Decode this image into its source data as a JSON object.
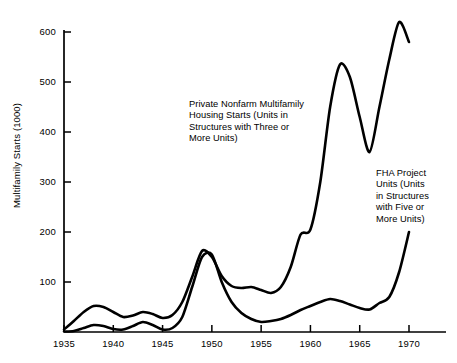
{
  "chart_data": {
    "type": "line",
    "title": "",
    "xlabel": "",
    "ylabel": "Multifamily Starts (1000)",
    "xlim": [
      1935,
      1971.5
    ],
    "ylim": [
      0,
      640
    ],
    "grid": false,
    "legend_position": "none (inline annotations)",
    "xticks": [
      "1935",
      "1940",
      "1945",
      "1950",
      "1955",
      "1960",
      "1965",
      "1970"
    ],
    "xtick_values": [
      1935,
      1940,
      1945,
      1950,
      1955,
      1960,
      1965,
      1970
    ],
    "yticks": [
      "100",
      "200",
      "300",
      "400",
      "500",
      "600"
    ],
    "ytick_values": [
      100,
      200,
      300,
      400,
      500,
      600
    ],
    "line_color": "#000000",
    "series": [
      {
        "name": "Private Nonfarm Multifamily Housing Starts (Units in Structures with Three or More Units)",
        "x": [
          1935,
          1936,
          1937,
          1938,
          1939,
          1940,
          1941,
          1942,
          1943,
          1944,
          1945,
          1946,
          1947,
          1948,
          1949,
          1950,
          1951,
          1952,
          1953,
          1954,
          1955,
          1956,
          1957,
          1958,
          1959,
          1960,
          1961,
          1962,
          1963,
          1964,
          1965,
          1966,
          1967,
          1968,
          1969,
          1970
        ],
        "values": [
          5,
          22,
          40,
          52,
          50,
          40,
          30,
          33,
          40,
          36,
          28,
          34,
          60,
          110,
          162,
          150,
          112,
          92,
          88,
          90,
          84,
          78,
          90,
          130,
          195,
          205,
          300,
          450,
          535,
          510,
          430,
          360,
          450,
          545,
          620,
          580
        ]
      },
      {
        "name": "FHA Project Units (Units in Structures with Five or More Units)",
        "x": [
          1935,
          1936,
          1937,
          1938,
          1939,
          1940,
          1941,
          1942,
          1943,
          1944,
          1945,
          1946,
          1947,
          1948,
          1949,
          1950,
          1951,
          1952,
          1953,
          1954,
          1955,
          1956,
          1957,
          1958,
          1959,
          1960,
          1961,
          1962,
          1963,
          1964,
          1965,
          1966,
          1967,
          1968,
          1969,
          1970
        ],
        "values": [
          1,
          2,
          8,
          14,
          12,
          6,
          5,
          12,
          20,
          14,
          5,
          8,
          30,
          90,
          150,
          155,
          100,
          60,
          38,
          26,
          20,
          22,
          26,
          34,
          44,
          52,
          60,
          66,
          62,
          55,
          48,
          45,
          58,
          70,
          120,
          200
        ]
      }
    ],
    "annotations": [
      {
        "name": "private-nonfarm-label",
        "lines": [
          "Private Nonfarm Multifamily",
          "Housing Starts (Units in",
          "Structures with Three or",
          "More Units)"
        ]
      },
      {
        "name": "fha-project-label",
        "lines": [
          "FHA Project",
          "Units (Units",
          "in Structures",
          "with Five or",
          "More Units)"
        ]
      }
    ]
  }
}
